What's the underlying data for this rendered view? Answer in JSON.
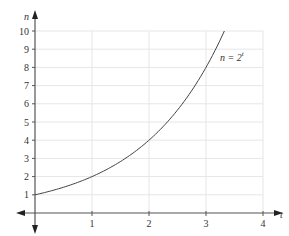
{
  "chart_data": {
    "type": "line",
    "title": "",
    "xlabel": "t",
    "ylabel": "n",
    "xlim": [
      0,
      4
    ],
    "ylim": [
      0,
      10
    ],
    "x_ticks": [
      1,
      2,
      3,
      4
    ],
    "y_ticks": [
      1,
      2,
      3,
      4,
      5,
      6,
      7,
      8,
      9,
      10
    ],
    "grid": true,
    "legend": null,
    "annotations": [
      {
        "text": "n = 2^t",
        "base": "n = 2",
        "sup": "t",
        "x": 3.35,
        "y": 8.5
      }
    ],
    "series": [
      {
        "name": "n = 2^t",
        "function": "2^t",
        "x": [
          0,
          0.5,
          1,
          1.5,
          2,
          2.5,
          3,
          3.322
        ],
        "values": [
          1,
          1.41,
          2,
          2.83,
          4,
          5.66,
          8,
          10
        ]
      }
    ]
  },
  "colors": {
    "axis": "#555555",
    "grid": "#e6e6e6",
    "curve": "#444444",
    "text": "#333333"
  }
}
